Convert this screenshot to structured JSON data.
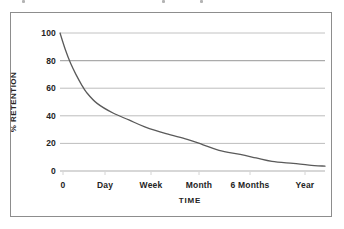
{
  "figure": {
    "background_color": "#ffffff",
    "frame_color": "#8d8d8d"
  },
  "chart_data": {
    "type": "line",
    "title": "",
    "subtitle": "",
    "xlabel": "TIME",
    "ylabel": "% RETENTION",
    "categories": [
      "0",
      "Day",
      "Week",
      "Month",
      "6 Months",
      "Year"
    ],
    "x": [
      0,
      1,
      2,
      3,
      4,
      5
    ],
    "xtick_labels": [
      "0",
      "Day",
      "Week",
      "Month",
      "6 Months",
      "Year"
    ],
    "ytick_labels": [
      "0",
      "20",
      "40",
      "60",
      "80",
      "100"
    ],
    "yticks": [
      0,
      20,
      40,
      60,
      80,
      100
    ],
    "ylim": [
      0,
      100
    ],
    "xlim": [
      0,
      5
    ],
    "grid": true,
    "grid_axis": "y",
    "grid_color": "#b9b9b9",
    "legend": false,
    "legend_position": "none",
    "series": [
      {
        "name": "Retention",
        "color": "#5a5a5a",
        "line_width": 1.3,
        "values": [
          100,
          42,
          27,
          15,
          7,
          3.5
        ],
        "curve_points": [
          {
            "x": 0.0,
            "y": 100
          },
          {
            "x": 0.1,
            "y": 88
          },
          {
            "x": 0.2,
            "y": 78
          },
          {
            "x": 0.3,
            "y": 70
          },
          {
            "x": 0.4,
            "y": 63
          },
          {
            "x": 0.5,
            "y": 57
          },
          {
            "x": 0.7,
            "y": 49
          },
          {
            "x": 1.0,
            "y": 42
          },
          {
            "x": 1.3,
            "y": 37
          },
          {
            "x": 1.6,
            "y": 32
          },
          {
            "x": 2.0,
            "y": 27
          },
          {
            "x": 2.4,
            "y": 23
          },
          {
            "x": 2.7,
            "y": 19
          },
          {
            "x": 3.0,
            "y": 15
          },
          {
            "x": 3.4,
            "y": 12
          },
          {
            "x": 3.7,
            "y": 9.5
          },
          {
            "x": 4.0,
            "y": 7
          },
          {
            "x": 4.4,
            "y": 5.5
          },
          {
            "x": 4.7,
            "y": 4.3
          },
          {
            "x": 5.0,
            "y": 3.5
          }
        ]
      }
    ]
  },
  "axis": {
    "y_tick_0": "0",
    "y_tick_20": "20",
    "y_tick_40": "40",
    "y_tick_60": "60",
    "y_tick_80": "80",
    "y_tick_100": "100",
    "x_tick_0": "0",
    "x_tick_day": "Day",
    "x_tick_week": "Week",
    "x_tick_month": "Month",
    "x_tick_6months": "6 Months",
    "x_tick_year": "Year",
    "x_title": "TIME",
    "y_title": "% RETENTION"
  }
}
